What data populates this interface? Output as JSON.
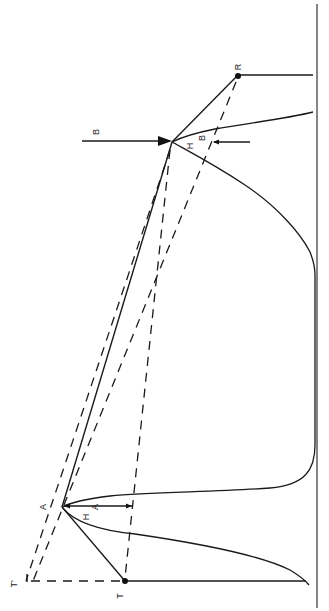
{
  "diagram": {
    "orientation": "rotated 90deg clockwise",
    "colors": {
      "ink": "#1a1a1a",
      "background": "#ffffff"
    },
    "labels": {
      "peak_a": "A",
      "peak_b_arrow": "B",
      "point_r": "R",
      "point_t": "T",
      "point_t_prime": "T'",
      "height_a_h": "H",
      "height_a_sub": "A",
      "height_b_h": "H",
      "height_b_sub": "B"
    },
    "points": {
      "A": [
        62,
        507
      ],
      "B": [
        172,
        142
      ],
      "R": [
        238,
        75
      ],
      "T": [
        125,
        581
      ],
      "T_prime": [
        27,
        582
      ]
    },
    "elements": [
      "baseline",
      "chromatogram curve with peaks A and B",
      "tangent lines R-B-A-T",
      "dashed construction lines to T'",
      "height arrows H_A and H_B",
      "injection arrow pointing at peak B"
    ]
  }
}
